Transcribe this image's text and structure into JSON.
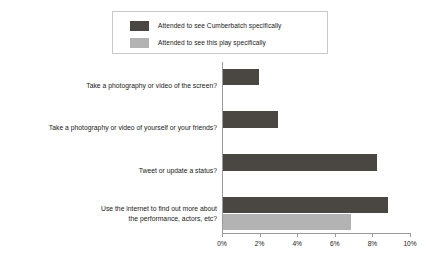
{
  "legend": {
    "entries": [
      {
        "label": "Attended to see Cumberbatch specifically",
        "color": "#4a4642",
        "swatch_name": "legend-swatch-cumberbatch"
      },
      {
        "label": "Attended to see this play specifically",
        "color": "#b3b3b3",
        "swatch_name": "legend-swatch-this-play"
      }
    ]
  },
  "chart_data": {
    "type": "bar",
    "orientation": "horizontal",
    "title": "",
    "subtitle": "",
    "xlabel": "",
    "ylabel": "",
    "xlim": [
      0,
      10
    ],
    "xunit": "%",
    "grid": false,
    "legend_position": "top",
    "tick_labels": [
      "0%",
      "2%",
      "4%",
      "6%",
      "8%",
      "10%"
    ],
    "tick_values": [
      0,
      2,
      4,
      6,
      8,
      10
    ],
    "categories": [
      "Take a photography or video of the screen?",
      "Take a photography or video of yourself or your friends?",
      "Tweet or update a status?",
      "Use the internet to find out more about\nthe performance, actors, etc?"
    ],
    "series": [
      {
        "name": "Attended to see Cumberbatch specifically",
        "color": "#4a4642",
        "values": [
          1.9,
          2.9,
          8.2,
          8.8
        ]
      },
      {
        "name": "Attended to see this play specifically",
        "color": "#b3b3b3",
        "values": [
          0,
          0,
          0,
          6.8
        ]
      }
    ]
  }
}
